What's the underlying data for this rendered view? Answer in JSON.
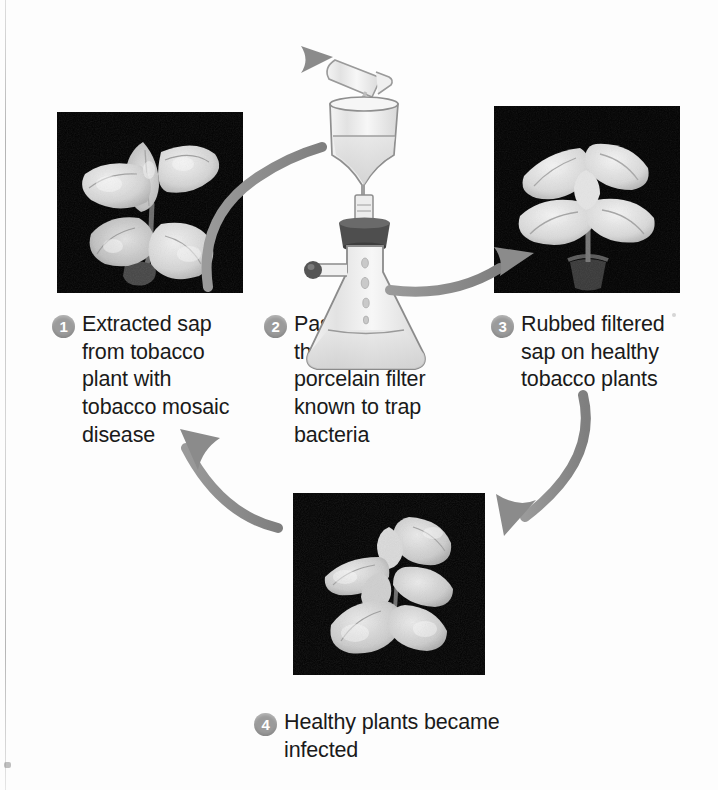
{
  "figure": {
    "background_color": "#fdfdfd",
    "accent_color": "#9b9b9b",
    "text_color": "#1a1a1a",
    "arrow_color": "#8e8e8e",
    "photo_background": "#080808"
  },
  "steps": [
    {
      "number": "1",
      "text": "Extracted sap\nfrom tobacco\nplant with\ntobacco mosaic\ndisease",
      "image_name": "diseased-tobacco-plant-photo",
      "image_alt": "Grayscale photograph of a tobacco plant with mottled mosaic-diseased leaves on a black background"
    },
    {
      "number": "2",
      "text": "Passed sap\nthrough a\nporcelain filter\nknown to trap\nbacteria",
      "image_name": "porcelain-filter-apparatus-illustration",
      "image_alt": "Illustration of a test tube pouring sap into a porcelain funnel filter seated in a stoppered side-arm Erlenmeyer flask"
    },
    {
      "number": "3",
      "text": "Rubbed filtered\nsap on healthy\ntobacco plants",
      "image_name": "healthy-tobacco-plant-photo",
      "image_alt": "Grayscale photograph of a healthy tobacco plant with broad pale leaves on a black background"
    },
    {
      "number": "4",
      "text": "Healthy plants became\ninfected",
      "image_name": "newly-infected-tobacco-plant-photo",
      "image_alt": "Grayscale photograph of a tobacco plant showing mosaic infection symptoms on a black background"
    }
  ],
  "arrows": [
    {
      "name": "arrow-step1-to-step2",
      "from": "1",
      "to": "2"
    },
    {
      "name": "arrow-step2-to-step3",
      "from": "2",
      "to": "3"
    },
    {
      "name": "arrow-step3-to-step4",
      "from": "3",
      "to": "4"
    },
    {
      "name": "arrow-step4-to-step1",
      "from": "4",
      "to": "1"
    }
  ]
}
